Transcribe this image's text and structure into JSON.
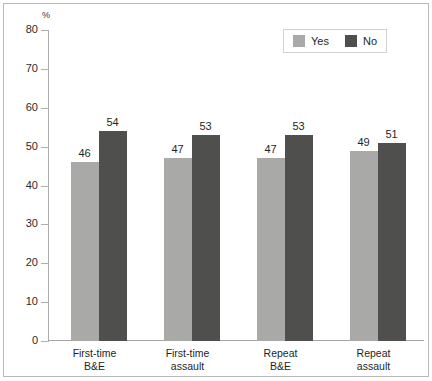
{
  "chart_data": {
    "type": "bar",
    "title": "",
    "subtitle": "",
    "xlabel": "",
    "ylabel": "%",
    "ylim": [
      0,
      80
    ],
    "ytick_step": 10,
    "yticks": [
      80,
      70,
      60,
      50,
      40,
      30,
      20,
      10,
      0
    ],
    "grid": false,
    "legend_position": "top-right",
    "categories": [
      "First-time B&E",
      "First-time assault",
      "Repeat B&E",
      "Repeat assault"
    ],
    "category_lines": [
      [
        "First-time",
        "B&E"
      ],
      [
        "First-time",
        "assault"
      ],
      [
        "Repeat",
        "B&E"
      ],
      [
        "Repeat",
        "assault"
      ]
    ],
    "series": [
      {
        "name": "Yes",
        "color": "#a9a9a7",
        "values": [
          46,
          47,
          47,
          49
        ]
      },
      {
        "name": "No",
        "color": "#4f4f4d",
        "values": [
          54,
          53,
          53,
          51
        ]
      }
    ]
  },
  "legend": {
    "entries": [
      {
        "label": "Yes"
      },
      {
        "label": "No"
      }
    ]
  },
  "axis": {
    "unit": "%"
  }
}
